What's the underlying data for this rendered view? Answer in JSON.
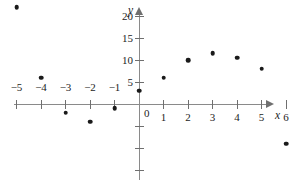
{
  "chart_data": {
    "type": "scatter",
    "title": "",
    "subtitle": "",
    "xlabel": "x",
    "ylabel": "y",
    "xlim": [
      -5.8,
      6.6
    ],
    "ylim": [
      -16,
      24
    ],
    "grid": false,
    "legend": null,
    "x_ticks": [
      -5,
      -4,
      -3,
      -2,
      -1,
      1,
      2,
      3,
      4,
      5,
      6
    ],
    "x_tick_labels": [
      "−5",
      "−4",
      "−3",
      "−2",
      "−1",
      "1",
      "2",
      "3",
      "4",
      "5",
      "6"
    ],
    "y_ticks": [
      5,
      10,
      15,
      20
    ],
    "y_tick_labels": [
      "5",
      "10",
      "15",
      "20"
    ],
    "y_minor_ticks": [
      -5,
      -10,
      -15
    ],
    "origin_label": "0",
    "points": [
      {
        "x": -5,
        "y": 22
      },
      {
        "x": -4,
        "y": 6
      },
      {
        "x": -3,
        "y": -2
      },
      {
        "x": -2,
        "y": -4
      },
      {
        "x": -1,
        "y": -1
      },
      {
        "x": 0,
        "y": 3
      },
      {
        "x": 1,
        "y": 6
      },
      {
        "x": 2,
        "y": 10
      },
      {
        "x": 3,
        "y": 11.5
      },
      {
        "x": 4,
        "y": 10.5
      },
      {
        "x": 5,
        "y": 8
      },
      {
        "x": 6,
        "y": -9
      }
    ],
    "marker_color": "#1a1a1a",
    "axis_color": "#8a8a8a",
    "background_color": "#ffffff"
  },
  "geometry": {
    "origin_px": {
      "x": 139,
      "y": 104
    },
    "x_unit_px": 24.5,
    "y_unit_px": 4.4
  }
}
